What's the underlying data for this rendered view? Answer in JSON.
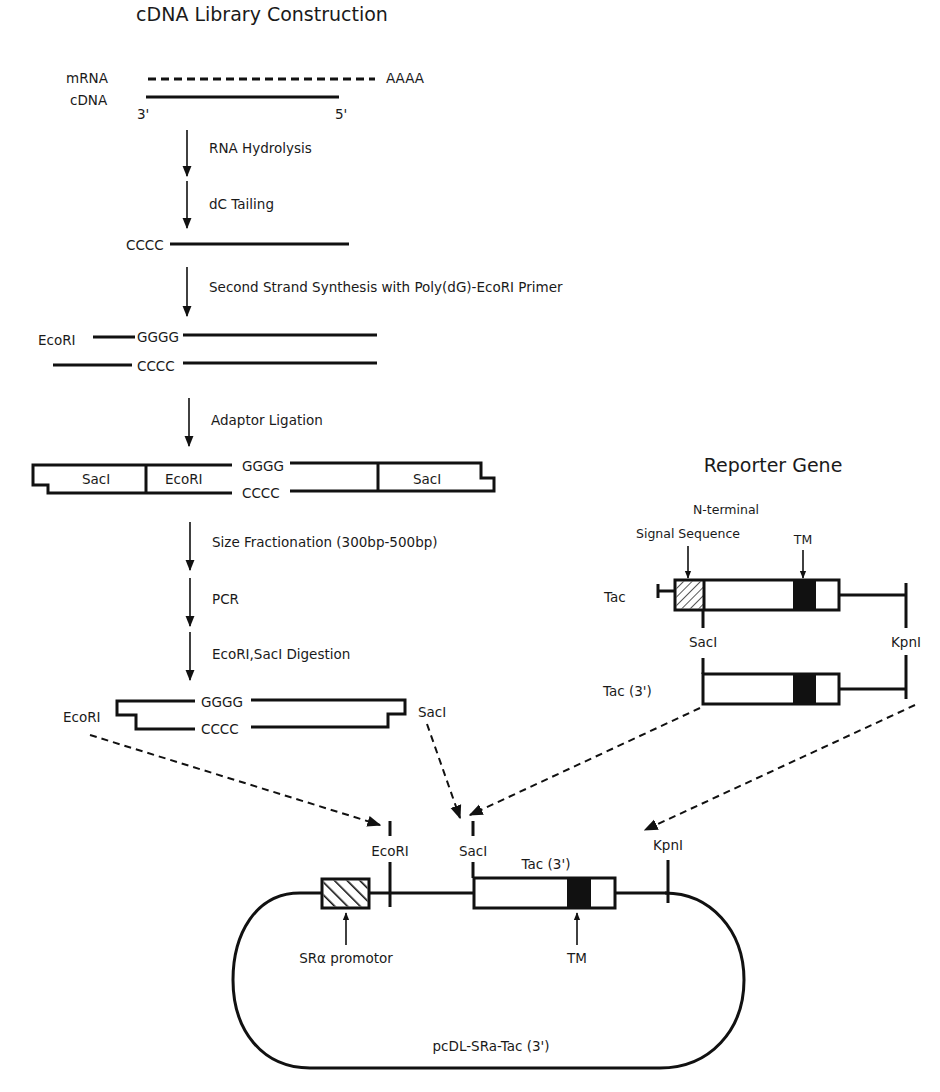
{
  "figure": {
    "left_title": "cDNA Library Construction",
    "right_title": "Reporter Gene"
  },
  "strands": {
    "mrna_label": "mRNA",
    "cdna_label": "cDNA",
    "polya": "AAAA",
    "three_prime": "3'",
    "five_prime": "5'",
    "cccc": "CCCC",
    "gggg": "GGGG",
    "ecori": "EcoRI",
    "saci": "SacI",
    "kpni": "KpnI"
  },
  "steps": [
    {
      "label": "RNA Hydrolysis"
    },
    {
      "label": "dC Tailing"
    },
    {
      "label": "Second Strand Synthesis with Poly(dG)-EcoRI Primer"
    },
    {
      "label": "Adaptor Ligation"
    },
    {
      "label": "Size Fractionation (300bp-500bp)"
    },
    {
      "label": "PCR"
    },
    {
      "label": "EcoRI,SacI Digestion"
    }
  ],
  "reporter": {
    "signal_label_line1": "N-terminal",
    "signal_label_line2": "Signal Sequence",
    "tm_label": "TM",
    "tac_label": "Tac",
    "tac3_label": "Tac (3')"
  },
  "plasmid": {
    "name": "pcDL-SRa-Tac (3')",
    "promoter_label": "SRα promotor",
    "insert_label": "Tac (3')",
    "tm_label": "TM"
  }
}
